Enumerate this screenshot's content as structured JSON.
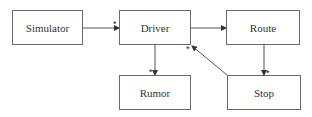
{
  "diagram": {
    "type": "class-association",
    "nodes": [
      {
        "id": "simulator",
        "label": "Simulator"
      },
      {
        "id": "driver",
        "label": "Driver"
      },
      {
        "id": "route",
        "label": "Route"
      },
      {
        "id": "rumor",
        "label": "Rumor"
      },
      {
        "id": "stop",
        "label": "Stop"
      }
    ],
    "edges": [
      {
        "from": "simulator",
        "to": "driver",
        "multiplicity": "*"
      },
      {
        "from": "driver",
        "to": "route",
        "multiplicity": ""
      },
      {
        "from": "driver",
        "to": "rumor",
        "multiplicity": "*"
      },
      {
        "from": "route",
        "to": "stop",
        "multiplicity": "*"
      },
      {
        "from": "stop",
        "to": "driver",
        "multiplicity": "*"
      }
    ],
    "colors": {
      "line": "#555555",
      "border": "#6a6a6a",
      "text": "#333333"
    }
  }
}
